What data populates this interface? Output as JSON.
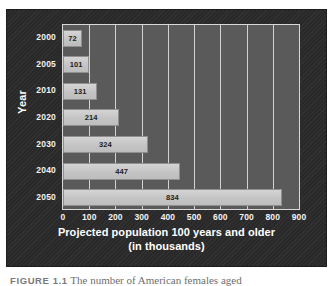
{
  "figure": {
    "caption_label": "FIGURE 1.1",
    "caption_text": "The number of American females aged"
  },
  "chart_data": {
    "type": "bar",
    "orientation": "horizontal",
    "title": "",
    "xlabel": "Projected population 100 years and older (in thousands)",
    "xlabel_line1": "Projected population 100 years and older",
    "xlabel_line2": "(in thousands)",
    "ylabel": "Year",
    "categories": [
      "2000",
      "2005",
      "2010",
      "2020",
      "2030",
      "2040",
      "2050"
    ],
    "values": [
      72,
      101,
      131,
      214,
      324,
      447,
      834
    ],
    "value_labels": [
      "72",
      "101",
      "131",
      "214",
      "324",
      "447",
      "834"
    ],
    "xlim": [
      0,
      900
    ],
    "xticks": [
      0,
      100,
      200,
      300,
      400,
      500,
      600,
      700,
      800,
      900
    ],
    "xtick_labels": [
      "0",
      "100",
      "200",
      "300",
      "400",
      "500",
      "600",
      "700",
      "800",
      "900"
    ],
    "grid": "vertical",
    "legend": "none",
    "colors": {
      "panel_background": "#2b2b2b",
      "plot_background": "#5a5a5a",
      "bar_fill": "#c9c9c9",
      "bar_border": "#8f8f8f",
      "gridline": "#e8e8e8",
      "axis_text": "#ffffff",
      "value_text": "#1d1d1d"
    }
  }
}
